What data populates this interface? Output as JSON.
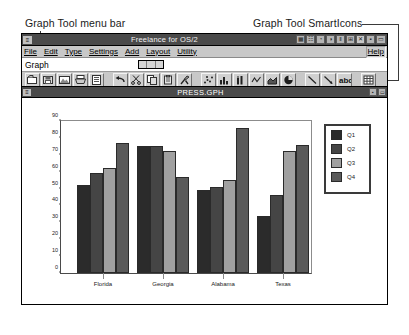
{
  "annotations": {
    "menubar_callout": "Graph Tool menu bar",
    "smarticons_callout": "Graph Tool SmartIcons"
  },
  "app_window": {
    "title": "Freelance for OS/2",
    "sysmenu_glyph": "≡",
    "titlebar_buttons": [
      {
        "name": "restore-tile-icon",
        "glyph": "▦"
      },
      {
        "name": "page-icon",
        "glyph": "☷"
      },
      {
        "name": "globe-icon",
        "glyph": "◔"
      },
      {
        "name": "clock-icon",
        "glyph": "◑"
      },
      {
        "name": "chart-icon",
        "glyph": "‖"
      },
      {
        "name": "grid-icon",
        "glyph": "⊞"
      },
      {
        "name": "close-icon",
        "glyph": "✕"
      },
      {
        "name": "minimize-icon",
        "glyph": "▪"
      },
      {
        "name": "maximize-icon",
        "glyph": "▭"
      }
    ],
    "menu": [
      {
        "label": "File",
        "accel": "F"
      },
      {
        "label": "Edit",
        "accel": "E"
      },
      {
        "label": "Type",
        "accel": "y"
      },
      {
        "label": "Settings",
        "accel": "S"
      },
      {
        "label": "Add",
        "accel": "A"
      },
      {
        "label": "Layout",
        "accel": "L"
      },
      {
        "label": "Utility",
        "accel": "U"
      }
    ],
    "help_label": "Help",
    "graph_strip_label": "Graph"
  },
  "smarticons": [
    {
      "name": "open-folder-icon"
    },
    {
      "name": "save-file-icon"
    },
    {
      "name": "image-import-icon"
    },
    {
      "name": "print-icon"
    },
    {
      "name": "page-layout-icon"
    },
    {
      "name": "undo-icon"
    },
    {
      "name": "cut-scissors-icon"
    },
    {
      "name": "copy-icon"
    },
    {
      "name": "paste-icon"
    },
    {
      "name": "tools-icon"
    },
    {
      "name": "scatter-chart-icon"
    },
    {
      "name": "bar-chart-icon"
    },
    {
      "name": "hi-lo-chart-icon"
    },
    {
      "name": "line-chart-icon"
    },
    {
      "name": "area-chart-icon"
    },
    {
      "name": "pie-chart-icon"
    },
    {
      "name": "line-draw-icon"
    },
    {
      "name": "arrow-draw-icon"
    },
    {
      "name": "text-abc-icon"
    },
    {
      "name": "table-grid-icon"
    }
  ],
  "doc_window": {
    "title": "PRESS.GPH",
    "sysmenu_glyph": "≡",
    "buttons": [
      {
        "name": "minimize-icon",
        "glyph": "▪"
      },
      {
        "name": "maximize-icon",
        "glyph": "▭"
      }
    ]
  },
  "chart_data": {
    "type": "bar",
    "title": "",
    "xlabel": "",
    "ylabel": "",
    "categories": [
      "Florida",
      "Georgia",
      "Alabama",
      "Texas"
    ],
    "series": [
      {
        "name": "Q1",
        "color": "#2b2b2b",
        "values": [
          52,
          75,
          49,
          34
        ]
      },
      {
        "name": "Q2",
        "color": "#454545",
        "values": [
          59,
          75,
          51,
          46
        ]
      },
      {
        "name": "Q3",
        "color": "#a0a0a0",
        "values": [
          62,
          72,
          55,
          72
        ]
      },
      {
        "name": "Q4",
        "color": "#5a5a5a",
        "values": [
          77,
          57,
          86,
          76
        ]
      }
    ],
    "yticks": [
      0,
      10,
      20,
      30,
      40,
      50,
      60,
      70,
      80,
      90
    ],
    "ylim": [
      0,
      90
    ],
    "grid": false,
    "legend_position": "right"
  }
}
